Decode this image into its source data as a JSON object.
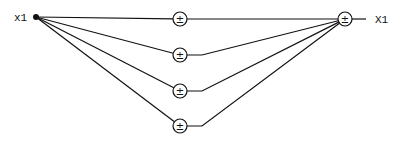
{
  "diagram": {
    "type": "signal-flow",
    "stroke_color": "#111111",
    "background": "#ffffff",
    "input": {
      "label": "x1",
      "x": 36,
      "y": 17,
      "label_x": 14,
      "label_y": 21
    },
    "output": {
      "label": "X1",
      "node_x": 345,
      "node_y": 19,
      "line_end_x": 366,
      "label_x": 375,
      "label_y": 23
    },
    "operator_symbol": "±",
    "node_radius": 7,
    "branches": [
      {
        "id": "branch-1",
        "node_x": 180,
        "node_y": 19,
        "bend_x": 180
      },
      {
        "id": "branch-2",
        "node_x": 180,
        "node_y": 55,
        "bend_x": 202
      },
      {
        "id": "branch-3",
        "node_x": 180,
        "node_y": 91,
        "bend_x": 202
      },
      {
        "id": "branch-4",
        "node_x": 180,
        "node_y": 126,
        "bend_x": 202
      }
    ]
  }
}
